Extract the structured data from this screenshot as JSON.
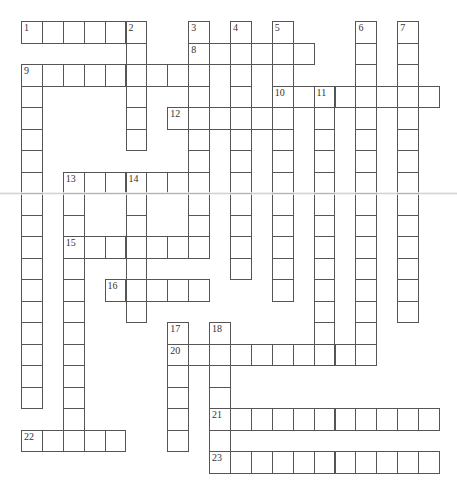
{
  "puzzle": {
    "type": "crossword",
    "grid_origin": {
      "x": 21,
      "y": 21
    },
    "cell_size": {
      "w": 20.9,
      "h": 21.5
    },
    "words": [
      {
        "number": "1",
        "direction": "across",
        "row": 0,
        "col": 0,
        "length": 6
      },
      {
        "number": "2",
        "direction": "down",
        "row": 0,
        "col": 5,
        "length": 6
      },
      {
        "number": "3",
        "direction": "down",
        "row": 0,
        "col": 8,
        "length": 11
      },
      {
        "number": "4",
        "direction": "down",
        "row": 0,
        "col": 10,
        "length": 12
      },
      {
        "number": "5",
        "direction": "down",
        "row": 0,
        "col": 12,
        "length": 13
      },
      {
        "number": "6",
        "direction": "down",
        "row": 0,
        "col": 16,
        "length": 16
      },
      {
        "number": "7",
        "direction": "down",
        "row": 0,
        "col": 18,
        "length": 14
      },
      {
        "number": "8",
        "direction": "across",
        "row": 1,
        "col": 8,
        "length": 6
      },
      {
        "number": "9",
        "direction": "across",
        "row": 2,
        "col": 0,
        "length": 9
      },
      {
        "number": "9",
        "direction": "down",
        "row": 2,
        "col": 0,
        "length": 16
      },
      {
        "number": "10",
        "direction": "across",
        "row": 3,
        "col": 12,
        "length": 8
      },
      {
        "number": "11",
        "direction": "down",
        "row": 3,
        "col": 14,
        "length": 13
      },
      {
        "number": "12",
        "direction": "across",
        "row": 4,
        "col": 7,
        "length": 6
      },
      {
        "number": "13",
        "direction": "across",
        "row": 7,
        "col": 2,
        "length": 7
      },
      {
        "number": "13",
        "direction": "down",
        "row": 7,
        "col": 2,
        "length": 13
      },
      {
        "number": "14",
        "direction": "down",
        "row": 7,
        "col": 5,
        "length": 7
      },
      {
        "number": "15",
        "direction": "across",
        "row": 10,
        "col": 2,
        "length": 7
      },
      {
        "number": "16",
        "direction": "across",
        "row": 12,
        "col": 4,
        "length": 5
      },
      {
        "number": "17",
        "direction": "down",
        "row": 14,
        "col": 7,
        "length": 6
      },
      {
        "number": "18",
        "direction": "down",
        "row": 14,
        "col": 9,
        "length": 7
      },
      {
        "number": "20",
        "direction": "across",
        "row": 15,
        "col": 7,
        "length": 10
      },
      {
        "number": "21",
        "direction": "across",
        "row": 18,
        "col": 9,
        "length": 11
      },
      {
        "number": "22",
        "direction": "across",
        "row": 19,
        "col": 0,
        "length": 5
      },
      {
        "number": "23",
        "direction": "across",
        "row": 20,
        "col": 9,
        "length": 11
      }
    ]
  }
}
